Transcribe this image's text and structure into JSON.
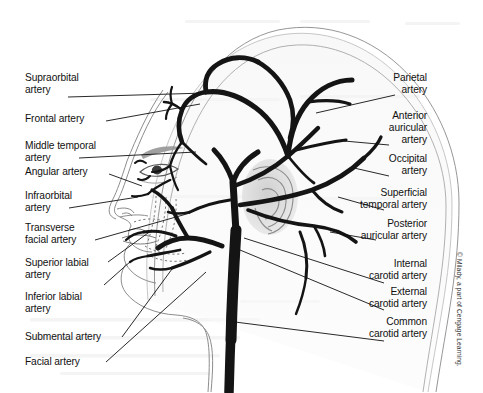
{
  "figure": {
    "background_color": "#ffffff",
    "ink_color": "#1a1a1a",
    "credit": "© Milady, a part of Cengage Learning."
  },
  "labels_left": [
    {
      "id": "supraorbital-artery",
      "text": "Supraorbital\nartery"
    },
    {
      "id": "frontal-artery",
      "text": "Frontal artery"
    },
    {
      "id": "middle-temporal-artery",
      "text": "Middle temporal\nartery"
    },
    {
      "id": "angular-artery",
      "text": "Angular artery"
    },
    {
      "id": "infraorbital-artery",
      "text": "Infraorbital\nartery"
    },
    {
      "id": "transverse-facial-artery",
      "text": "Transverse\nfacial artery"
    },
    {
      "id": "superior-labial-artery",
      "text": "Superior labial\nartery"
    },
    {
      "id": "inferior-labial-artery",
      "text": "Inferior labial\nartery"
    },
    {
      "id": "submental-artery",
      "text": "Submental artery"
    },
    {
      "id": "facial-artery",
      "text": "Facial artery"
    }
  ],
  "labels_right": [
    {
      "id": "parietal-artery",
      "text": "Parietal\nartery"
    },
    {
      "id": "anterior-auricular-artery",
      "text": "Anterior\nauricular\nartery"
    },
    {
      "id": "occipital-artery",
      "text": "Occipital\nartery"
    },
    {
      "id": "superficial-temporal-artery",
      "text": "Superficial\ntemporal artery"
    },
    {
      "id": "posterior-auricular-artery",
      "text": "Posterior\nauricular artery"
    },
    {
      "id": "internal-carotid-artery",
      "text": "Internal\ncarotid artery"
    },
    {
      "id": "external-carotid-artery",
      "text": "External\ncarotid artery"
    },
    {
      "id": "common-carotid-artery",
      "text": "Common\ncarotid artery"
    }
  ]
}
